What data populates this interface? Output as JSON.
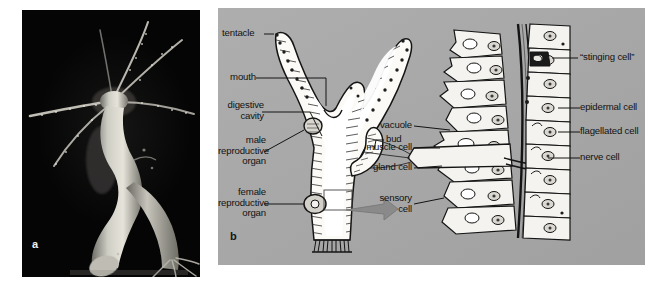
{
  "figure": {
    "panels": [
      {
        "id": "a",
        "letter": "a",
        "type": "photomicrograph",
        "caption_text": "a",
        "subject": "Hydra dark-field photomicrograph",
        "background_color": "#050505",
        "organism_color": "#cfcdc4"
      },
      {
        "id": "b",
        "letter": "b",
        "type": "labeled-line-drawing",
        "caption_text": "b",
        "background_color": "#a9a9a9"
      }
    ],
    "hydra_labels": [
      {
        "key": "tentacle",
        "text": "tentacle"
      },
      {
        "key": "mouth",
        "text": "mouth"
      },
      {
        "key": "digestive_cavity",
        "text": "digestive\ncavity"
      },
      {
        "key": "male_reproductive",
        "text": "male\nreproductive\norgan"
      },
      {
        "key": "female_reproductive",
        "text": "female\nreproductive\norgan"
      },
      {
        "key": "bud",
        "text": "bud"
      }
    ],
    "cell_inset_labels_left": [
      {
        "key": "vacuole",
        "text": "vacuole"
      },
      {
        "key": "muscle_cell",
        "text": "muscle cell"
      },
      {
        "key": "gland_cell",
        "text": "gland cell"
      },
      {
        "key": "sensory_cell",
        "text": "sensory\ncell"
      }
    ],
    "cell_inset_labels_right": [
      {
        "key": "stinging_cell",
        "text": "“stinging cell”"
      },
      {
        "key": "epidermal_cell",
        "text": "epidermal cell"
      },
      {
        "key": "flagellated_cell",
        "text": "flagellated cell"
      },
      {
        "key": "nerve_cell",
        "text": "nerve cell"
      }
    ],
    "colors": {
      "plate_gray": "#a9a9a9",
      "photo_black": "#050505",
      "ink": "#121212",
      "arrow_gray": "#8a8a8a",
      "cell_fill": "#f4f3ef"
    }
  }
}
